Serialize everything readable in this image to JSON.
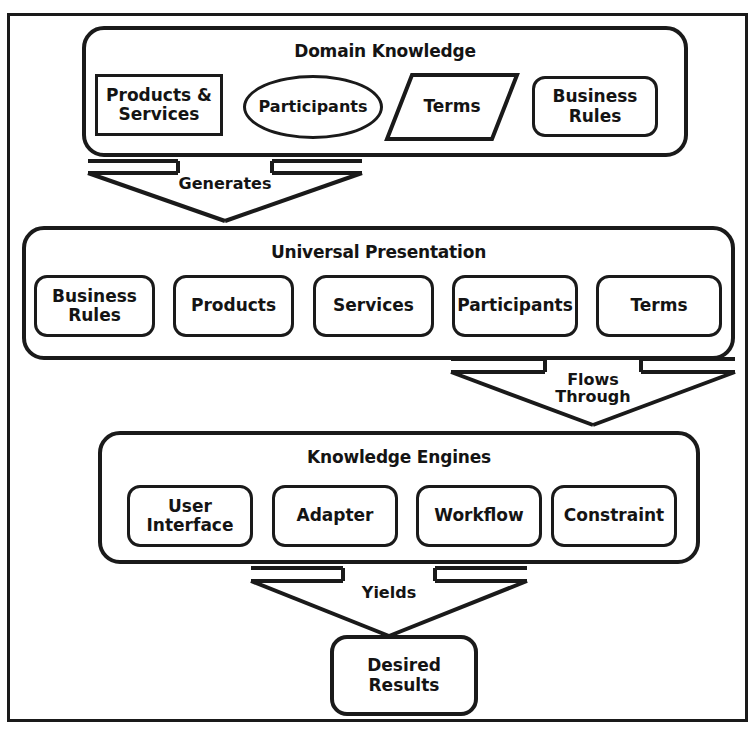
{
  "diagram": {
    "title_visible": false,
    "line_color": "#1a1a1a",
    "background": "#ffffff",
    "groups": [
      {
        "id": "domain-knowledge",
        "title": "Domain Knowledge",
        "nodes": [
          {
            "label": "Products &\nServices",
            "shape": "rectangle"
          },
          {
            "label": "Participants",
            "shape": "ellipse"
          },
          {
            "label": "Terms",
            "shape": "parallelogram"
          },
          {
            "label": "Business\nRules",
            "shape": "rounded-rectangle"
          }
        ]
      },
      {
        "id": "universal-presentation",
        "title": "Universal Presentation",
        "nodes": [
          {
            "label": "Business\nRules",
            "shape": "rounded-rectangle"
          },
          {
            "label": "Products",
            "shape": "rounded-rectangle"
          },
          {
            "label": "Services",
            "shape": "rounded-rectangle"
          },
          {
            "label": "Participants",
            "shape": "rounded-rectangle"
          },
          {
            "label": "Terms",
            "shape": "rounded-rectangle"
          }
        ]
      },
      {
        "id": "knowledge-engines",
        "title": "Knowledge Engines",
        "nodes": [
          {
            "label": "User\nInterface",
            "shape": "rounded-rectangle"
          },
          {
            "label": "Adapter",
            "shape": "rounded-rectangle"
          },
          {
            "label": "Workflow",
            "shape": "rounded-rectangle"
          },
          {
            "label": "Constraint",
            "shape": "rounded-rectangle"
          }
        ]
      }
    ],
    "connectors": [
      {
        "id": "generates",
        "label": "Generates",
        "from": "domain-knowledge",
        "to": "universal-presentation"
      },
      {
        "id": "flows-through",
        "label": "Flows\nThrough",
        "from": "universal-presentation",
        "to": "knowledge-engines"
      },
      {
        "id": "yields",
        "label": "Yields",
        "from": "knowledge-engines",
        "to": "desired-results"
      }
    ],
    "terminal": {
      "id": "desired-results",
      "label": "Desired\nResults",
      "shape": "rounded-rectangle"
    }
  }
}
